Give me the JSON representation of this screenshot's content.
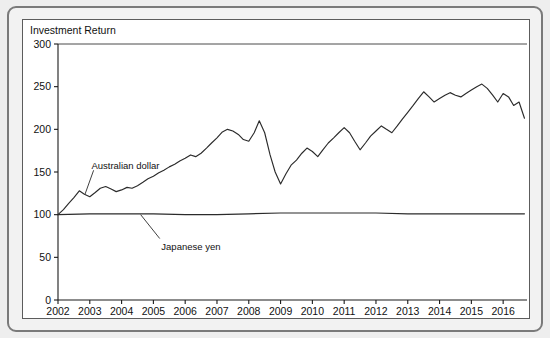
{
  "figure": {
    "background_color": "#eeeeee",
    "panel_color": "#ffffff",
    "frame_color": "#7a7a7a",
    "line_color": "#2b2b2b"
  },
  "chart_data": {
    "type": "line",
    "title": "Investment Return",
    "xlabel": "",
    "ylabel": "",
    "xlim": [
      2002,
      2016.75
    ],
    "ylim": [
      0,
      300
    ],
    "yticks": [
      0,
      50,
      100,
      150,
      200,
      250,
      300
    ],
    "ytick_labels": [
      "0",
      "50",
      "100",
      "150",
      "200",
      "250",
      "300"
    ],
    "xticks": [
      2002,
      2003,
      2004,
      2005,
      2006,
      2007,
      2008,
      2009,
      2010,
      2011,
      2012,
      2013,
      2014,
      2015,
      2016
    ],
    "xtick_labels": [
      "2002",
      "2003",
      "2004",
      "2005",
      "2006",
      "2007",
      "2008",
      "2009",
      "2010",
      "2011",
      "2012",
      "2013",
      "2014",
      "2015",
      "2016"
    ],
    "grid": false,
    "legend": "inline-annotations",
    "annotations": [
      {
        "text": "Australian dollar",
        "label_x": 2003.05,
        "label_y": 158,
        "leader_from_x": 2003.12,
        "leader_from_y": 152,
        "leader_to_x": 2002.85,
        "leader_to_y": 124
      },
      {
        "text": "Japanese yen",
        "label_x": 2005.25,
        "label_y": 63,
        "leader_from_x": 2005.2,
        "leader_from_y": 72,
        "leader_to_x": 2004.6,
        "leader_to_y": 100
      }
    ],
    "series": [
      {
        "name": "Australian dollar",
        "x": [
          2002.0,
          2002.17,
          2002.33,
          2002.5,
          2002.67,
          2002.83,
          2003.0,
          2003.17,
          2003.33,
          2003.5,
          2003.67,
          2003.83,
          2004.0,
          2004.17,
          2004.33,
          2004.5,
          2004.67,
          2004.83,
          2005.0,
          2005.17,
          2005.33,
          2005.5,
          2005.67,
          2005.83,
          2006.0,
          2006.17,
          2006.33,
          2006.5,
          2006.67,
          2006.83,
          2007.0,
          2007.17,
          2007.33,
          2007.5,
          2007.67,
          2007.83,
          2008.0,
          2008.17,
          2008.33,
          2008.5,
          2008.67,
          2008.83,
          2009.0,
          2009.17,
          2009.33,
          2009.5,
          2009.67,
          2009.83,
          2010.0,
          2010.17,
          2010.33,
          2010.5,
          2010.67,
          2010.83,
          2011.0,
          2011.17,
          2011.33,
          2011.5,
          2011.67,
          2011.83,
          2012.0,
          2012.17,
          2012.33,
          2012.5,
          2012.67,
          2012.83,
          2013.0,
          2013.17,
          2013.33,
          2013.5,
          2013.67,
          2013.83,
          2014.0,
          2014.17,
          2014.33,
          2014.5,
          2014.67,
          2014.83,
          2015.0,
          2015.17,
          2015.33,
          2015.5,
          2015.67,
          2015.83,
          2016.0,
          2016.17,
          2016.33,
          2016.5,
          2016.67
        ],
        "values": [
          100,
          106,
          113,
          120,
          128,
          124,
          121,
          126,
          131,
          133,
          130,
          127,
          129,
          132,
          131,
          134,
          138,
          142,
          145,
          149,
          152,
          156,
          159,
          163,
          166,
          170,
          168,
          172,
          178,
          184,
          190,
          197,
          200,
          198,
          194,
          188,
          186,
          196,
          210,
          196,
          170,
          150,
          136,
          148,
          158,
          164,
          172,
          178,
          174,
          168,
          176,
          184,
          190,
          196,
          202,
          196,
          186,
          176,
          184,
          192,
          198,
          204,
          200,
          196,
          204,
          212,
          220,
          228,
          236,
          244,
          238,
          232,
          236,
          240,
          243,
          240,
          238,
          242,
          246,
          250,
          253,
          248,
          240,
          232,
          242,
          238,
          228,
          232,
          213
        ]
      },
      {
        "name": "Japanese yen",
        "x": [
          2002.0,
          2003.0,
          2004.0,
          2005.0,
          2006.0,
          2007.0,
          2008.0,
          2009.0,
          2010.0,
          2011.0,
          2012.0,
          2013.0,
          2014.0,
          2015.0,
          2016.0,
          2016.67
        ],
        "values": [
          100,
          101,
          101,
          101,
          100,
          100,
          101,
          102,
          102,
          102,
          102,
          101,
          101,
          101,
          101,
          101
        ]
      }
    ]
  }
}
